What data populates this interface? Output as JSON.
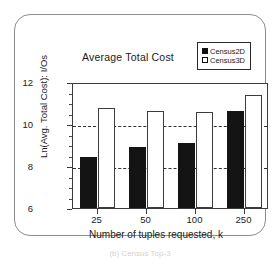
{
  "chart_data": {
    "type": "bar",
    "title": "Average Total Cost",
    "xlabel": "Number of tuples requested, k",
    "ylabel": "Ln(Avg. Total Cost): I/Os",
    "categories": [
      "25",
      "50",
      "100",
      "250"
    ],
    "series": [
      {
        "name": "Census2D",
        "values": [
          8.45,
          8.9,
          9.1,
          10.6
        ],
        "color": "#141414",
        "fill": "solid"
      },
      {
        "name": "Census3D",
        "values": [
          10.75,
          10.6,
          10.55,
          11.4
        ],
        "color": "#ffffff",
        "fill": "hollow"
      }
    ],
    "ylim": [
      6,
      12
    ],
    "yticks": [
      "6",
      "8",
      "10",
      "12"
    ],
    "ytick_values": [
      6,
      8,
      10,
      12
    ],
    "gridlines": [
      8,
      10
    ],
    "grid": true,
    "legend_position": "top-right"
  },
  "legend": {
    "entries": [
      {
        "label": "Census2D",
        "style": "filled"
      },
      {
        "label": "Census3D",
        "style": "hollow"
      }
    ]
  },
  "caption": {
    "text": "(b) Census Top-3"
  }
}
